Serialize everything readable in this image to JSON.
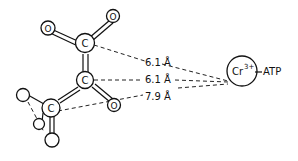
{
  "diagram": {
    "atoms": [
      {
        "id": "O1",
        "label": "O"
      },
      {
        "id": "O2",
        "label": "O"
      },
      {
        "id": "C1",
        "label": "C"
      },
      {
        "id": "C2",
        "label": "C"
      },
      {
        "id": "O3",
        "label": "O"
      },
      {
        "id": "C3",
        "label": "C"
      },
      {
        "id": "X1",
        "label": ""
      },
      {
        "id": "X2",
        "label": ""
      },
      {
        "id": "X3",
        "label": ""
      }
    ],
    "metal": {
      "label": "Cr",
      "charge": "3+",
      "ligand": "ATP"
    },
    "distances": [
      {
        "from": "C1",
        "label": "6.1 Å"
      },
      {
        "from": "C2",
        "label": "6.1 Å"
      },
      {
        "from": "C3",
        "label": "7.9 Å"
      }
    ]
  }
}
